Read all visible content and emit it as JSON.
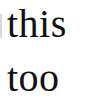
{
  "text": {
    "line1": "this",
    "line2": "too"
  },
  "colors": {
    "text": "#111111",
    "background": "#ffffff"
  }
}
